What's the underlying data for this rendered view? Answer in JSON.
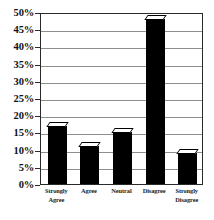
{
  "chart_data": {
    "type": "bar",
    "title": "",
    "subtitle": "",
    "xlabel": "",
    "ylabel": "",
    "categories": [
      "Strongly Agree",
      "Agree",
      "Neutral",
      "Disagree",
      "Strongly Disagree"
    ],
    "values": [
      17,
      11,
      15,
      48,
      9
    ],
    "ylim": [
      0,
      50
    ],
    "ytick_step": 5,
    "ytick_labels": [
      "0%",
      "5%",
      "10%",
      "15%",
      "20%",
      "25%",
      "30%",
      "35%",
      "40%",
      "45%",
      "50%"
    ],
    "ytick_values": [
      0,
      5,
      10,
      15,
      20,
      25,
      30,
      35,
      40,
      45,
      50
    ],
    "grid": true,
    "grid_axis": "y",
    "legend": false,
    "legend_position": "none",
    "bar_color": "#000000",
    "bar_cap_color": "#ffffff",
    "grid_color": "#8e8e8e",
    "frame_color": "#2a2a2a",
    "background_color": "#ffffff",
    "annotations": []
  },
  "category_label_lines": [
    [
      "Strongly",
      "Agree"
    ],
    [
      "Agree"
    ],
    [
      "Neutral"
    ],
    [
      "Disagree"
    ],
    [
      "Strongly",
      "Disagree"
    ]
  ]
}
